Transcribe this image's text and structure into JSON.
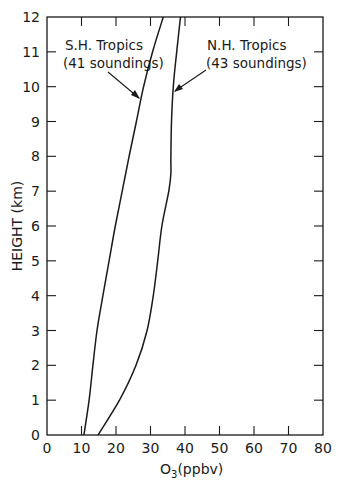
{
  "chart_data": {
    "type": "line",
    "title": "",
    "xlabel": "O3(ppbv)",
    "xlabel_main": "O",
    "xlabel_sub": "3",
    "xlabel_unit": "(ppbv)",
    "ylabel": "HEIGHT (km)",
    "xlim": [
      0,
      80
    ],
    "ylim": [
      0,
      12
    ],
    "xticks": [
      0,
      10,
      20,
      30,
      40,
      50,
      60,
      70,
      80
    ],
    "yticks": [
      0,
      1,
      2,
      3,
      4,
      5,
      6,
      7,
      8,
      9,
      10,
      11,
      12
    ],
    "grid": false,
    "legend": "none (inline annotations with arrows)",
    "series": [
      {
        "name": "S.H. Tropics",
        "annotation": [
          "S.H. Tropics",
          "(41 soundings)"
        ],
        "soundings": 41,
        "points": [
          {
            "o3": 10.7,
            "height": 0
          },
          {
            "o3": 12.2,
            "height": 1
          },
          {
            "o3": 13.3,
            "height": 2
          },
          {
            "o3": 14.5,
            "height": 3
          },
          {
            "o3": 16.2,
            "height": 4
          },
          {
            "o3": 18.0,
            "height": 5
          },
          {
            "o3": 19.8,
            "height": 6
          },
          {
            "o3": 21.8,
            "height": 7
          },
          {
            "o3": 23.8,
            "height": 8
          },
          {
            "o3": 25.9,
            "height": 9
          },
          {
            "o3": 28.0,
            "height": 10
          },
          {
            "o3": 30.6,
            "height": 11
          },
          {
            "o3": 33.7,
            "height": 12
          }
        ]
      },
      {
        "name": "N.H. Tropics",
        "annotation": [
          "N.H. Tropics",
          "(43 soundings)"
        ],
        "soundings": 43,
        "points": [
          {
            "o3": 14.8,
            "height": 0
          },
          {
            "o3": 21.0,
            "height": 1
          },
          {
            "o3": 25.8,
            "height": 2
          },
          {
            "o3": 29.0,
            "height": 3
          },
          {
            "o3": 30.8,
            "height": 4
          },
          {
            "o3": 32.1,
            "height": 5
          },
          {
            "o3": 33.3,
            "height": 6
          },
          {
            "o3": 35.3,
            "height": 7
          },
          {
            "o3": 35.9,
            "height": 7.5
          },
          {
            "o3": 35.9,
            "height": 8
          },
          {
            "o3": 36.1,
            "height": 9
          },
          {
            "o3": 36.6,
            "height": 10
          },
          {
            "o3": 37.6,
            "height": 11
          },
          {
            "o3": 38.7,
            "height": 12
          }
        ]
      }
    ]
  }
}
